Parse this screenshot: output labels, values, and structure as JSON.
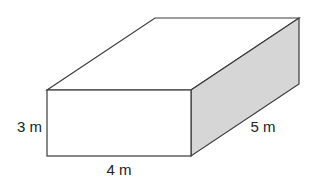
{
  "diagram": {
    "type": "rectangular-prism",
    "colors": {
      "edge": "#3a3a3a",
      "front_face": "#ffffff",
      "top_face": "#ffffff",
      "side_face": "#d6d6d6",
      "label": "#222222"
    },
    "vertices": {
      "front_top_left": [
        47,
        90
      ],
      "front_top_right": [
        191,
        90
      ],
      "front_bottom_left": [
        47,
        156
      ],
      "front_bottom_right": [
        191,
        156
      ],
      "back_top_left": [
        155,
        18
      ],
      "back_top_right": [
        299,
        18
      ],
      "back_bottom_right": [
        299,
        84
      ]
    },
    "labels": {
      "height": "3 m",
      "width": "4 m",
      "depth": "5 m"
    }
  }
}
